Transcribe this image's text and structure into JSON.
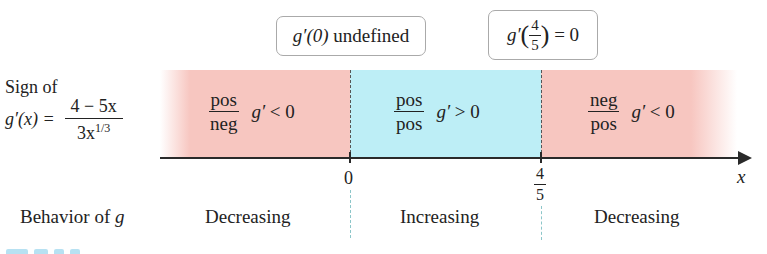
{
  "callouts": {
    "left": {
      "fn": "g′(0)",
      "text": "undefined"
    },
    "right": {
      "fn": "g′",
      "num": "4",
      "den": "5",
      "rhs": "= 0"
    }
  },
  "sign_row": {
    "label_line1": "Sign of",
    "lhs": "g′(x) =",
    "numerator": "4 − 5x",
    "denominator_base": "3x",
    "denominator_exp": "1/3"
  },
  "regions": [
    {
      "num": "pos",
      "den": "neg",
      "g_prime": "g′",
      "relation": "< 0",
      "sign": "negative",
      "color": "#f7c6c0"
    },
    {
      "num": "pos",
      "den": "pos",
      "g_prime": "g′",
      "relation": "> 0",
      "sign": "positive",
      "color": "#bdeef6"
    },
    {
      "num": "neg",
      "den": "pos",
      "g_prime": "g′",
      "relation": "< 0",
      "sign": "negative",
      "color": "#f7c6c0"
    }
  ],
  "axis": {
    "variable": "x",
    "points": [
      {
        "label": "0"
      },
      {
        "num": "4",
        "den": "5"
      }
    ]
  },
  "behavior_row": {
    "label": "Behavior of",
    "label_var": "g",
    "values": [
      "Decreasing",
      "Increasing",
      "Decreasing"
    ]
  }
}
